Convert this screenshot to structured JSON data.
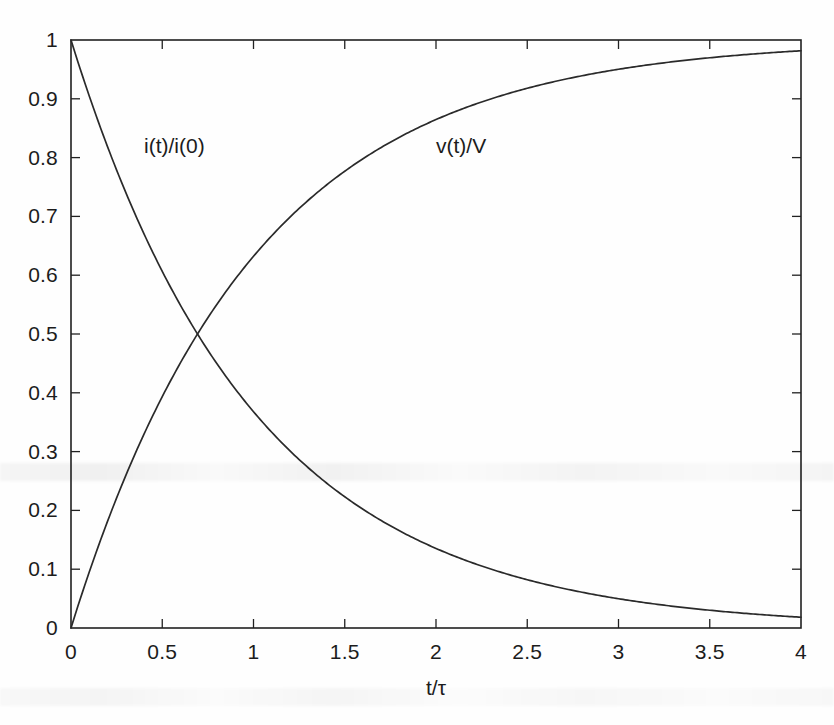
{
  "figure": {
    "background_color": "#fefefe",
    "ink_color": "#212121"
  },
  "axes": {
    "x_title": "t/τ",
    "y_title": "",
    "x_ticks": [
      "0",
      "0.5",
      "1",
      "1.5",
      "2",
      "2.5",
      "3",
      "3.5",
      "4"
    ],
    "y_ticks": [
      "0",
      "0.1",
      "0.2",
      "0.3",
      "0.4",
      "0.5",
      "0.6",
      "0.7",
      "0.8",
      "0.9",
      "1"
    ]
  },
  "annotations": {
    "decay_label": "i(t)/i(0)",
    "rise_label": "v(t)/V"
  },
  "chart_data": {
    "type": "line",
    "title": "",
    "subtitle": "",
    "xlabel": "t/τ",
    "ylabel": "",
    "xlim": [
      0,
      4
    ],
    "ylim": [
      0,
      1
    ],
    "xticks": [
      0,
      0.5,
      1,
      1.5,
      2,
      2.5,
      3,
      3.5,
      4
    ],
    "yticks": [
      0,
      0.1,
      0.2,
      0.3,
      0.4,
      0.5,
      0.6,
      0.7,
      0.8,
      0.9,
      1
    ],
    "grid": false,
    "legend": "inline-annotations",
    "box_frame": true,
    "tick_direction": "in",
    "series": [
      {
        "name": "i(t)/i(0)",
        "formula": "exp(-t/tau)",
        "label_position": {
          "x": 0.4,
          "y": 0.82
        },
        "x": [
          0,
          0.1,
          0.2,
          0.3,
          0.4,
          0.5,
          0.6,
          0.693,
          0.8,
          0.9,
          1.0,
          1.2,
          1.4,
          1.6,
          1.8,
          2.0,
          2.2,
          2.4,
          2.6,
          2.8,
          3.0,
          3.2,
          3.4,
          3.6,
          3.8,
          4.0
        ],
        "values": [
          1.0,
          0.905,
          0.819,
          0.741,
          0.67,
          0.607,
          0.549,
          0.5,
          0.449,
          0.407,
          0.368,
          0.301,
          0.247,
          0.202,
          0.165,
          0.135,
          0.111,
          0.091,
          0.074,
          0.061,
          0.05,
          0.041,
          0.033,
          0.027,
          0.022,
          0.018
        ]
      },
      {
        "name": "v(t)/V",
        "formula": "1 - exp(-t/tau)",
        "label_position": {
          "x": 2.0,
          "y": 0.82
        },
        "x": [
          0,
          0.1,
          0.2,
          0.3,
          0.4,
          0.5,
          0.6,
          0.693,
          0.8,
          0.9,
          1.0,
          1.2,
          1.4,
          1.6,
          1.8,
          2.0,
          2.2,
          2.4,
          2.6,
          2.8,
          3.0,
          3.2,
          3.4,
          3.6,
          3.8,
          4.0
        ],
        "values": [
          0.0,
          0.095,
          0.181,
          0.259,
          0.33,
          0.393,
          0.451,
          0.5,
          0.551,
          0.593,
          0.632,
          0.699,
          0.753,
          0.798,
          0.835,
          0.865,
          0.889,
          0.909,
          0.926,
          0.939,
          0.95,
          0.959,
          0.967,
          0.973,
          0.978,
          0.982
        ]
      }
    ],
    "crossing_point": {
      "x": 0.693,
      "y": 0.5,
      "note": "curves intersect at t = ln(2)·τ"
    }
  }
}
